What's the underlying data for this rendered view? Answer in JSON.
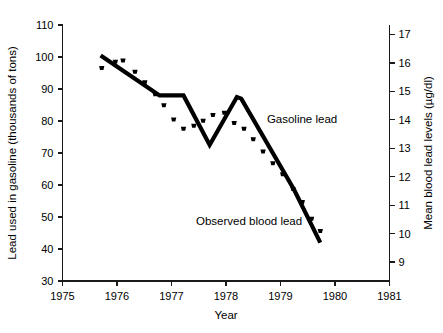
{
  "chart_data": {
    "type": "line",
    "title": "",
    "subtitle": "",
    "xlabel": "Year",
    "ylabel": "Lead used in gasoline (thousands of tons)",
    "y2label": "Mean blood lead levels (µg/dl)",
    "xlim": [
      1975,
      1981
    ],
    "ylim": [
      30,
      110
    ],
    "y2lim": [
      8.333,
      17.333
    ],
    "grid": false,
    "legend_position": "inline-annotations",
    "x_ticks": [
      "1975",
      "1976",
      "1977",
      "1978",
      "1979",
      "1980",
      "1981"
    ],
    "x_tick_values": [
      1975,
      1976,
      1977,
      1978,
      1979,
      1980,
      1981
    ],
    "y_ticks": [
      "30",
      "40",
      "50",
      "60",
      "70",
      "80",
      "90",
      "100",
      "110"
    ],
    "y_tick_values": [
      30,
      40,
      50,
      60,
      70,
      80,
      90,
      100,
      110
    ],
    "y2_ticks": [
      "9",
      "10",
      "11",
      "12",
      "13",
      "14",
      "15",
      "16",
      "17"
    ],
    "y2_tick_values": [
      9,
      10,
      11,
      12,
      13,
      14,
      15,
      16,
      17
    ],
    "annotations": [
      {
        "text": "Gasoline lead",
        "x": 1978.75,
        "y": 79.5
      },
      {
        "text": "Observed blood lead",
        "x": 1977.45,
        "y": 47.5
      }
    ],
    "series": [
      {
        "name": "Gasoline lead",
        "style": "line",
        "axis": "left",
        "unit": "thousands of tons",
        "x": [
          1975.7,
          1976.78,
          1977.22,
          1977.7,
          1978.2,
          1978.28,
          1979.25,
          1979.73
        ],
        "values": [
          100.5,
          88.0,
          88.0,
          72.5,
          87.5,
          87.0,
          58.5,
          42.0
        ]
      },
      {
        "name": "Observed blood lead",
        "style": "dots",
        "axis": "right",
        "unit": "µg/dl",
        "x": [
          1975.72,
          1975.97,
          1976.11,
          1976.33,
          1976.51,
          1976.7,
          1976.86,
          1977.04,
          1977.22,
          1977.41,
          1977.58,
          1977.76,
          1977.97,
          1978.15,
          1978.33,
          1978.5,
          1978.68,
          1978.86,
          1979.04,
          1979.23,
          1979.4,
          1979.57,
          1979.73
        ],
        "values": [
          15.85,
          16.07,
          16.12,
          15.72,
          15.35,
          14.93,
          14.54,
          14.04,
          13.72,
          13.82,
          14.0,
          14.2,
          14.28,
          13.92,
          13.72,
          13.35,
          12.92,
          12.5,
          12.12,
          11.6,
          11.14,
          10.55,
          10.12
        ],
        "values_left_axis_equivalent": [
          97.4,
          99.3,
          100.5,
          97.2,
          92.8,
          89.0,
          85.5,
          81.1,
          82.8,
          83.0,
          84.6,
          86.0,
          83.5,
          82.5,
          82.5,
          79.6,
          75.9,
          72.2,
          68.8,
          64.2,
          60.1,
          54.9,
          51.1
        ]
      }
    ]
  },
  "figure": {
    "background_color": "#ffffff",
    "line_color": "#000000",
    "axis_color": "#1a1a1a"
  }
}
